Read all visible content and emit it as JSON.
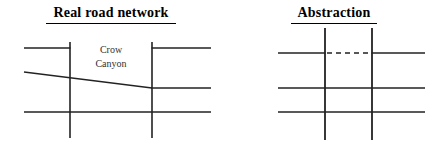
{
  "figure": {
    "panels": [
      {
        "id": "real-road-network",
        "title": "Real road network",
        "labels": [
          {
            "id": "crow-canyon",
            "line1": "Crow",
            "line2": "Canyon"
          }
        ],
        "diagram": {
          "type": "road-network",
          "stroke_color": "#222222",
          "stroke_width": 1.4,
          "vertical_roads": [
            {
              "id": "v1",
              "x": 70,
              "y1": 42,
              "y2": 138,
              "style": "solid"
            },
            {
              "id": "v2",
              "x": 152,
              "y1": 42,
              "y2": 138,
              "style": "solid"
            }
          ],
          "horizontal_roads": [
            {
              "id": "h1-left",
              "x1": 24,
              "y1": 48,
              "x2": 70,
              "y2": 48,
              "style": "solid"
            },
            {
              "id": "h1-right",
              "x1": 152,
              "y1": 48,
              "x2": 211,
              "y2": 48,
              "style": "solid"
            },
            {
              "id": "crow-canyon-road-west",
              "x1": 24,
              "y1": 72,
              "x2": 152,
              "y2": 88,
              "style": "solid"
            },
            {
              "id": "crow-canyon-road-east",
              "x1": 152,
              "y1": 88,
              "x2": 211,
              "y2": 88,
              "style": "solid"
            },
            {
              "id": "h3",
              "x1": 24,
              "y1": 112,
              "x2": 211,
              "y2": 112,
              "style": "solid"
            }
          ]
        }
      },
      {
        "id": "abstraction",
        "title": "Abstraction",
        "labels": [],
        "diagram": {
          "type": "road-network",
          "stroke_color": "#222222",
          "stroke_width": 1.6,
          "vertical_roads": [
            {
              "id": "v1",
              "x": 102,
              "y1": 28,
              "y2": 140,
              "style": "solid"
            },
            {
              "id": "v2",
              "x": 149,
              "y1": 28,
              "y2": 140,
              "style": "solid"
            }
          ],
          "horizontal_roads": [
            {
              "id": "h1-left",
              "x1": 55,
              "y1": 53,
              "x2": 102,
              "y2": 53,
              "style": "solid"
            },
            {
              "id": "h1-middle",
              "x1": 102,
              "y1": 53,
              "x2": 149,
              "y2": 53,
              "style": "dashed"
            },
            {
              "id": "h1-right",
              "x1": 149,
              "y1": 53,
              "x2": 202,
              "y2": 53,
              "style": "solid"
            },
            {
              "id": "h2",
              "x1": 55,
              "y1": 88,
              "x2": 202,
              "y2": 88,
              "style": "solid"
            },
            {
              "id": "h3",
              "x1": 55,
              "y1": 112,
              "x2": 202,
              "y2": 112,
              "style": "solid"
            }
          ]
        }
      }
    ]
  }
}
